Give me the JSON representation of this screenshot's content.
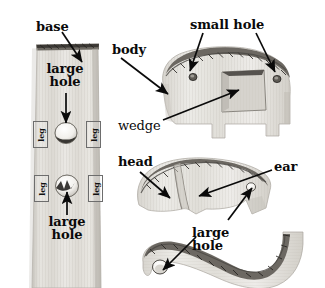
{
  "figure": {
    "kind": "woodworking-cut-parts-diagram",
    "background_color": "#ffffff",
    "ink_color": "#0a0a0a",
    "wood_fill": "#e3e1dc",
    "wood_shadow": "#c9c6bf",
    "wood_edge": "#595category"
  },
  "labels": {
    "base": "base",
    "large_hole_top": "large hole",
    "large_hole_base_bottom": "large hole",
    "large_hole_trunk": "large hole",
    "leg_1": "leg",
    "leg_2": "leg",
    "leg_3": "leg",
    "leg_4": "leg",
    "body": "body",
    "small_hole": "small hole",
    "wedge": "wedge",
    "head": "head",
    "ear": "ear"
  },
  "parts": [
    {
      "id": "base",
      "name": "base",
      "description": "long vertical wooden plank with rough dark top edge",
      "features": [
        "large hole",
        "large hole",
        "leg",
        "leg",
        "leg",
        "leg"
      ]
    },
    {
      "id": "body",
      "name": "body",
      "description": "elephant body silhouette with legs and rough sawn back edge",
      "features": [
        "small hole",
        "small hole",
        "wedge"
      ]
    },
    {
      "id": "head",
      "name": "head",
      "description": "elephant head blank with ear groove",
      "features": [
        "ear"
      ]
    },
    {
      "id": "trunk",
      "name": "trunk",
      "description": "curved trunk strip with hole at the tip",
      "features": [
        "large hole"
      ]
    }
  ],
  "callouts": [
    {
      "label": "base",
      "target_part": "base",
      "arrow": "down-right"
    },
    {
      "label": "large hole",
      "target_part": "base",
      "arrow": "down"
    },
    {
      "label": "large hole",
      "target_part": "base",
      "arrow": "up"
    },
    {
      "label": "body",
      "target_part": "body",
      "arrow": "down-right"
    },
    {
      "label": "small hole",
      "target_part": "body",
      "arrow": "down-left"
    },
    {
      "label": "small hole",
      "target_part": "body",
      "arrow": "down-right"
    },
    {
      "label": "wedge",
      "target_part": "body",
      "arrow": "up-right"
    },
    {
      "label": "head",
      "target_part": "head",
      "arrow": "down-right"
    },
    {
      "label": "ear",
      "target_part": "head",
      "arrow": "down-left"
    },
    {
      "label": "large hole",
      "target_part": "trunk",
      "arrow": "down-left"
    }
  ],
  "counts": {
    "legs_on_base": 4,
    "large_holes_on_base": 2,
    "small_holes_on_body": 2
  }
}
